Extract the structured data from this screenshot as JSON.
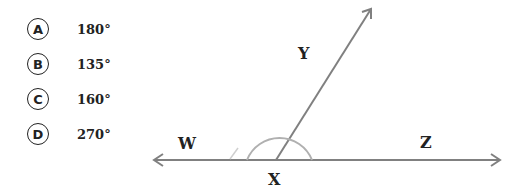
{
  "question": {
    "options": [
      {
        "letter": "A",
        "value": "180°"
      },
      {
        "letter": "B",
        "value": "135°"
      },
      {
        "letter": "C",
        "value": "160°"
      },
      {
        "letter": "D",
        "value": "270°"
      }
    ]
  },
  "diagram": {
    "labels": {
      "W": "W",
      "X": "X",
      "Y": "Y",
      "Z": "Z"
    },
    "line_color": "#808080",
    "arc_color": "#b0b0b0"
  }
}
